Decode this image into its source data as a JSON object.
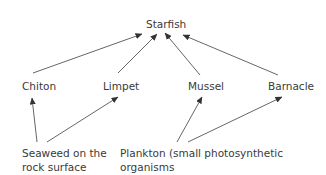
{
  "diagram": {
    "type": "food-web",
    "nodes": {
      "starfish": {
        "label": "Starfish"
      },
      "chiton": {
        "label": "Chiton"
      },
      "limpet": {
        "label": "Limpet"
      },
      "mussel": {
        "label": "Mussel"
      },
      "barnacle": {
        "label": "Barnacle"
      },
      "seaweed": {
        "lines": [
          "Seaweed on the",
          "rock surface"
        ]
      },
      "plankton": {
        "lines": [
          "Plankton (small photosynthetic organisms",
          "and animals which feed on them)"
        ]
      }
    },
    "edges": [
      {
        "from": "chiton",
        "to": "starfish"
      },
      {
        "from": "limpet",
        "to": "starfish"
      },
      {
        "from": "mussel",
        "to": "starfish"
      },
      {
        "from": "barnacle",
        "to": "starfish"
      },
      {
        "from": "seaweed",
        "to": "chiton"
      },
      {
        "from": "seaweed",
        "to": "limpet"
      },
      {
        "from": "plankton",
        "to": "mussel"
      },
      {
        "from": "plankton",
        "to": "barnacle"
      }
    ],
    "colors": {
      "text": "#3a3a3a",
      "arrow": "#555555",
      "background": "#ffffff"
    }
  }
}
